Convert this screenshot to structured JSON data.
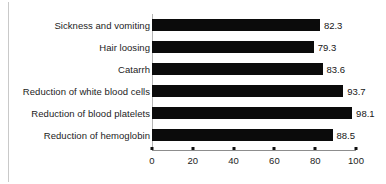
{
  "chart_data": {
    "type": "bar",
    "orientation": "horizontal",
    "title": "",
    "xlabel": "",
    "ylabel": "",
    "xlim": [
      0,
      100
    ],
    "grid": false,
    "legend": false,
    "xticks": [
      0,
      20,
      40,
      60,
      80,
      100
    ],
    "xtick_labels": [
      "0",
      "20",
      "40",
      "60",
      "80",
      "100"
    ],
    "bar_color": "#0b0b0b",
    "axis_color": "#8d8d8d",
    "categories": [
      "Sickness and vomiting",
      "Hair loosing",
      "Catarrh",
      "Reduction of white blood cells",
      "Reduction of blood platelets",
      "Reduction of hemoglobin"
    ],
    "values": [
      82.3,
      79.3,
      83.6,
      93.7,
      98.1,
      88.5
    ],
    "value_labels": [
      "82.3",
      "79.3",
      "83.6",
      "93.7",
      "98.1",
      "88.5"
    ]
  }
}
